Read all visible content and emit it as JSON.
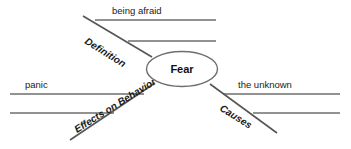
{
  "diagram": {
    "type": "spider-map",
    "title_topic": "Fear",
    "center": {
      "label": "Fear",
      "shape": "ellipse",
      "cx": 182,
      "cy": 69,
      "rx": 35,
      "ry": 17.5
    },
    "colors": {
      "line": "#6e6e6e",
      "branch_line": "#555555",
      "ellipse_stroke": "#6e6e6e",
      "text": "#1a1a1a",
      "background": "#ffffff"
    },
    "branches": [
      {
        "id": "definition",
        "label": "Definition",
        "rotation": 32,
        "label_x": 84,
        "label_y": 43,
        "line": {
          "x1": 83,
          "y1": 16,
          "x2": 152,
          "y2": 57
        },
        "detail_lines": [
          {
            "x1": 95,
            "y1": 20,
            "x2": 216,
            "y2": 20
          },
          {
            "x1": 128,
            "y1": 41,
            "x2": 216,
            "y2": 41
          }
        ],
        "details": [
          {
            "text": "being afraid",
            "x": 112,
            "y": 14,
            "anchor": "start"
          }
        ]
      },
      {
        "id": "effects-on-behavior",
        "label": "Effects on Behavior",
        "rotation": -32,
        "label_x": 77,
        "label_y": 133,
        "line": {
          "x1": 70,
          "y1": 140,
          "x2": 155,
          "y2": 83
        },
        "detail_lines": [
          {
            "x1": 10,
            "y1": 94,
            "x2": 144,
            "y2": 94
          },
          {
            "x1": 10,
            "y1": 113,
            "x2": 114,
            "y2": 113
          }
        ],
        "details": [
          {
            "text": "panic",
            "x": 25,
            "y": 88,
            "anchor": "start"
          }
        ]
      },
      {
        "id": "causes",
        "label": "Causes",
        "rotation": 32,
        "label_x": 219,
        "label_y": 110,
        "line": {
          "x1": 210,
          "y1": 84,
          "x2": 277,
          "y2": 133
        },
        "detail_lines": [
          {
            "x1": 223,
            "y1": 94,
            "x2": 340,
            "y2": 94
          },
          {
            "x1": 253,
            "y1": 113,
            "x2": 340,
            "y2": 113
          }
        ],
        "details": [
          {
            "text": "the unknown",
            "x": 238,
            "y": 88,
            "anchor": "start"
          }
        ]
      }
    ]
  }
}
